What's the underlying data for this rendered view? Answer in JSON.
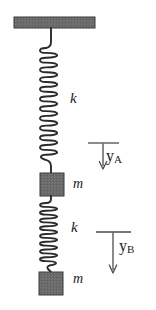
{
  "figure": {
    "background_color": "#ffffff",
    "ink_color": "#1a1a1a",
    "body_fill_color": "#6a6a6a",
    "body_edge_color": "#2b2b2b"
  },
  "labels": {
    "spring_top": "k",
    "spring_bottom": "k",
    "mass_top": "m",
    "mass_bottom": "m",
    "coord_a_symbol": "y",
    "coord_a_subscript": "A",
    "coord_b_symbol": "y",
    "coord_b_subscript": "B"
  },
  "icons": {
    "ceiling": "ceiling-support-icon",
    "spring": "helical-spring-icon",
    "mass": "mass-block-icon",
    "arrow": "down-arrow-icon",
    "datum": "datum-tick-icon"
  },
  "geometry": {
    "ceiling": {
      "x": 14,
      "y": 17,
      "width": 81,
      "height": 11
    },
    "spring_top": {
      "cx": 51,
      "top": 48,
      "bottom": 160,
      "coil_width": 17,
      "coils": 23
    },
    "spring_bottom": {
      "cx": 51,
      "top": 203,
      "bottom": 265,
      "coil_width": 17,
      "coils": 16
    },
    "mass_top": {
      "x": 40,
      "y": 173,
      "width": 24,
      "height": 23
    },
    "mass_bottom": {
      "x": 39,
      "y": 272,
      "width": 24,
      "height": 23
    },
    "arrow_a": {
      "tick_x1": 88,
      "tick_x2": 119,
      "tick_y": 143,
      "shaft_x": 103,
      "shaft_y2": 169
    },
    "arrow_b": {
      "tick_x1": 96,
      "tick_x2": 131,
      "tick_y": 232,
      "shaft_x": 113,
      "shaft_y2": 273
    }
  }
}
